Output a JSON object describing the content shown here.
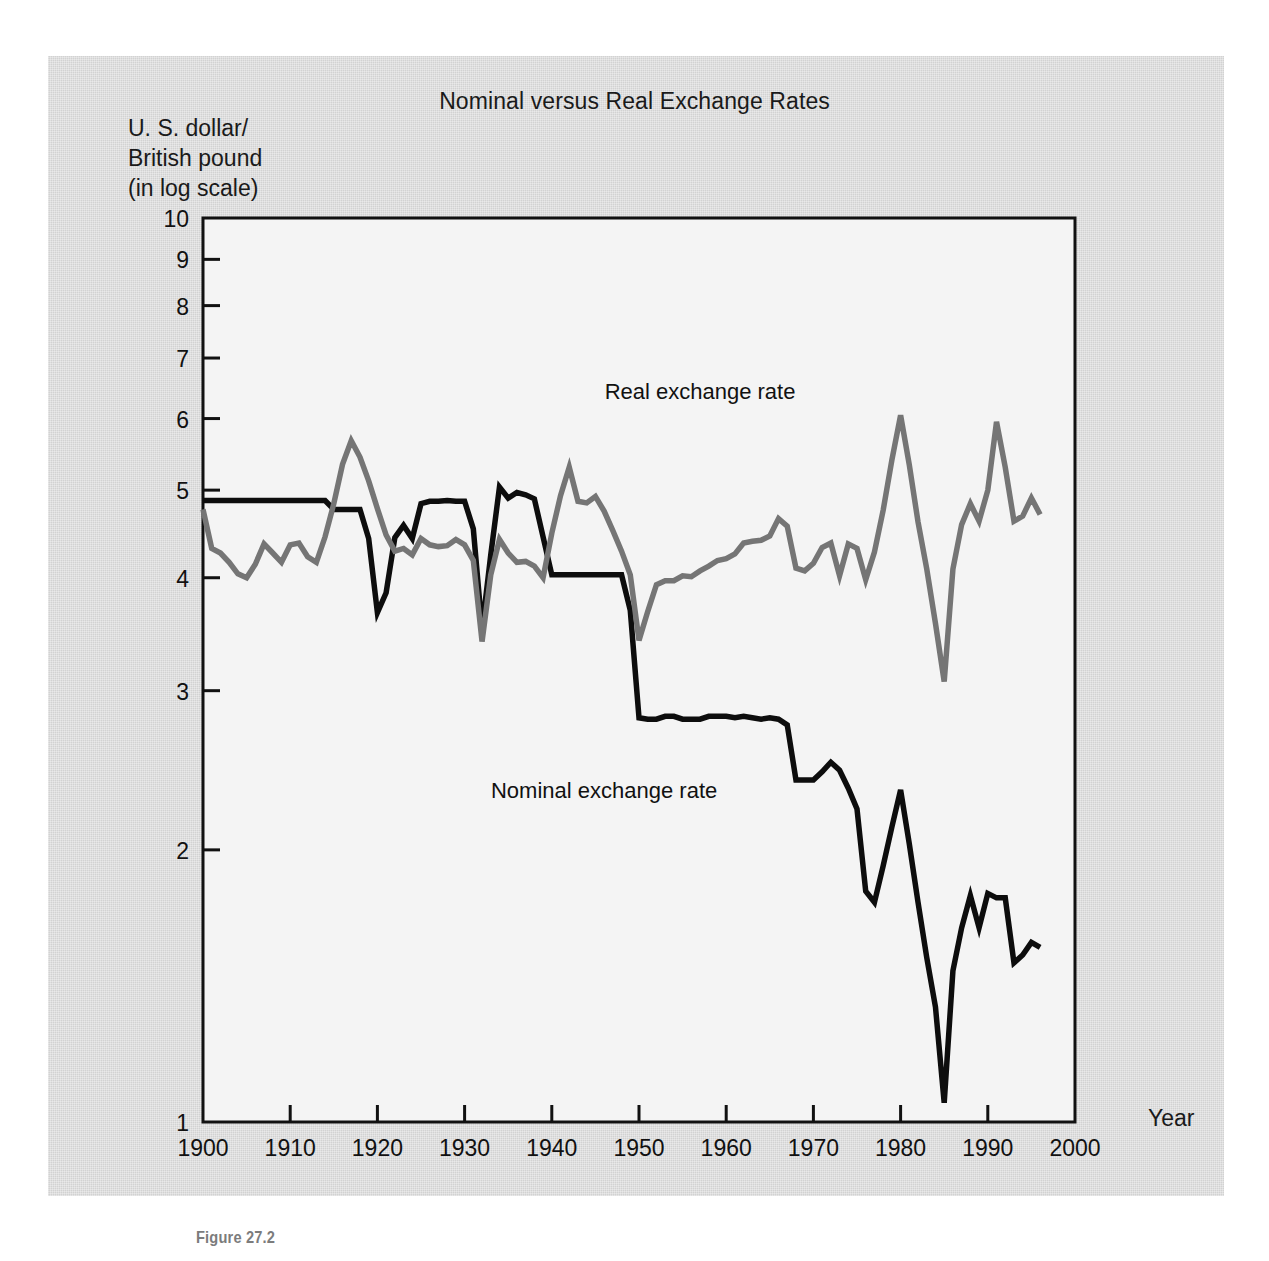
{
  "figure": {
    "caption": "Figure 27.2",
    "title": "Nominal versus Real Exchange Rates",
    "y_axis_caption": "U. S. dollar/\nBritish pound\n(in log scale)",
    "x_axis_caption": "Year"
  },
  "colors": {
    "nominal_line": "#0d0d0d",
    "real_line": "#757575",
    "plate_background": "#d2d2d2",
    "plot_background": "#f4f4f4",
    "axis": "#111111",
    "caption_text": "#7c7c7c"
  },
  "labels": {
    "real_series": "Real exchange rate",
    "nominal_series": "Nominal exchange rate"
  },
  "chart_data": {
    "type": "line",
    "title": "Nominal versus Real Exchange Rates",
    "xlabel": "Year",
    "ylabel": "U. S. dollar/British pound (in log scale)",
    "xlim": [
      1900,
      2000
    ],
    "ylim": [
      1,
      10
    ],
    "yscale": "log",
    "grid": false,
    "legend": "inline-annotations",
    "xticks": [
      1900,
      1910,
      1920,
      1930,
      1940,
      1950,
      1960,
      1970,
      1980,
      1990,
      2000
    ],
    "yticks": [
      1,
      2,
      3,
      4,
      5,
      6,
      7,
      8,
      9,
      10
    ],
    "series": [
      {
        "name": "Nominal exchange rate",
        "color": "#0d0d0d",
        "x": [
          1900,
          1901,
          1902,
          1903,
          1904,
          1905,
          1906,
          1907,
          1908,
          1909,
          1910,
          1911,
          1912,
          1913,
          1914,
          1915,
          1916,
          1917,
          1918,
          1919,
          1920,
          1921,
          1922,
          1923,
          1924,
          1925,
          1926,
          1927,
          1928,
          1929,
          1930,
          1931,
          1932,
          1933,
          1934,
          1935,
          1936,
          1937,
          1938,
          1939,
          1940,
          1941,
          1942,
          1943,
          1944,
          1945,
          1946,
          1947,
          1948,
          1949,
          1950,
          1951,
          1952,
          1953,
          1954,
          1955,
          1956,
          1957,
          1958,
          1959,
          1960,
          1961,
          1962,
          1963,
          1964,
          1965,
          1966,
          1967,
          1968,
          1969,
          1970,
          1971,
          1972,
          1973,
          1974,
          1975,
          1976,
          1977,
          1978,
          1979,
          1980,
          1981,
          1982,
          1983,
          1984,
          1985,
          1986,
          1987,
          1988,
          1989,
          1990,
          1991,
          1992,
          1993,
          1994,
          1995,
          1996
        ],
        "values": [
          4.87,
          4.87,
          4.87,
          4.87,
          4.87,
          4.87,
          4.87,
          4.87,
          4.87,
          4.87,
          4.87,
          4.87,
          4.87,
          4.87,
          4.87,
          4.76,
          4.76,
          4.76,
          4.76,
          4.42,
          3.66,
          3.85,
          4.43,
          4.57,
          4.42,
          4.83,
          4.86,
          4.86,
          4.87,
          4.86,
          4.86,
          4.53,
          3.51,
          4.24,
          5.04,
          4.9,
          4.97,
          4.94,
          4.89,
          4.44,
          4.03,
          4.03,
          4.03,
          4.03,
          4.03,
          4.03,
          4.03,
          4.03,
          4.03,
          3.68,
          2.8,
          2.79,
          2.79,
          2.81,
          2.81,
          2.79,
          2.79,
          2.79,
          2.81,
          2.81,
          2.81,
          2.8,
          2.81,
          2.8,
          2.79,
          2.8,
          2.79,
          2.75,
          2.39,
          2.39,
          2.39,
          2.44,
          2.5,
          2.45,
          2.34,
          2.22,
          1.8,
          1.75,
          1.92,
          2.12,
          2.33,
          2.03,
          1.75,
          1.52,
          1.34,
          1.05,
          1.47,
          1.64,
          1.78,
          1.64,
          1.79,
          1.77,
          1.77,
          1.5,
          1.53,
          1.58,
          1.56
        ]
      },
      {
        "name": "Real exchange rate",
        "color": "#757575",
        "x": [
          1900,
          1901,
          1902,
          1903,
          1904,
          1905,
          1906,
          1907,
          1908,
          1909,
          1910,
          1911,
          1912,
          1913,
          1914,
          1915,
          1916,
          1917,
          1918,
          1919,
          1920,
          1921,
          1922,
          1923,
          1924,
          1925,
          1926,
          1927,
          1928,
          1929,
          1930,
          1931,
          1932,
          1933,
          1934,
          1935,
          1936,
          1937,
          1938,
          1939,
          1940,
          1941,
          1942,
          1943,
          1944,
          1945,
          1946,
          1947,
          1948,
          1949,
          1950,
          1951,
          1952,
          1953,
          1954,
          1955,
          1956,
          1957,
          1958,
          1959,
          1960,
          1961,
          1962,
          1963,
          1964,
          1965,
          1966,
          1967,
          1968,
          1969,
          1970,
          1971,
          1972,
          1973,
          1974,
          1975,
          1976,
          1977,
          1978,
          1979,
          1980,
          1981,
          1982,
          1983,
          1984,
          1985,
          1986,
          1987,
          1988,
          1989,
          1990,
          1991,
          1992,
          1993,
          1994,
          1995,
          1996
        ],
        "values": [
          4.76,
          4.31,
          4.26,
          4.16,
          4.04,
          4.0,
          4.14,
          4.36,
          4.26,
          4.16,
          4.35,
          4.37,
          4.22,
          4.16,
          4.44,
          4.83,
          5.34,
          5.67,
          5.44,
          5.12,
          4.77,
          4.46,
          4.28,
          4.31,
          4.24,
          4.42,
          4.35,
          4.33,
          4.34,
          4.41,
          4.35,
          4.18,
          3.4,
          4.03,
          4.41,
          4.26,
          4.16,
          4.17,
          4.12,
          4.0,
          4.48,
          4.93,
          5.3,
          4.86,
          4.84,
          4.92,
          4.74,
          4.51,
          4.28,
          4.03,
          3.41,
          3.67,
          3.93,
          3.97,
          3.97,
          4.02,
          4.01,
          4.07,
          4.12,
          4.18,
          4.2,
          4.25,
          4.37,
          4.39,
          4.4,
          4.45,
          4.65,
          4.56,
          4.1,
          4.07,
          4.15,
          4.32,
          4.37,
          4.02,
          4.36,
          4.31,
          3.98,
          4.27,
          4.75,
          5.4,
          6.05,
          5.33,
          4.61,
          4.09,
          3.56,
          3.07,
          4.09,
          4.58,
          4.83,
          4.62,
          5.0,
          5.95,
          5.3,
          4.62,
          4.68,
          4.9,
          4.7
        ]
      }
    ],
    "annotations": [
      {
        "text": "Real exchange rate",
        "x": 1957,
        "y": 6.3
      },
      {
        "text": "Nominal exchange rate",
        "x": 1946,
        "y": 2.28
      }
    ]
  }
}
